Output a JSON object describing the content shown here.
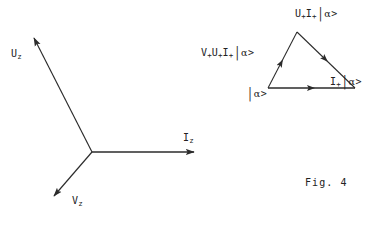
{
  "figure": {
    "caption": "Fig. 4",
    "background_color": "#ffffff",
    "ink_color": "#2b2b2b"
  },
  "axes_diagram": {
    "name": "three-axis-vector-diagram",
    "origin": {
      "x": 92,
      "y": 152
    },
    "vectors": [
      {
        "id": "uz",
        "label_base": "U",
        "label_sub": "z",
        "tip": {
          "x": 32,
          "y": 36
        },
        "direction": "up-left"
      },
      {
        "id": "iz",
        "label_base": "I",
        "label_sub": "z",
        "tip": {
          "x": 196,
          "y": 152
        },
        "direction": "right"
      },
      {
        "id": "vz",
        "label_base": "V",
        "label_sub": "z",
        "tip": {
          "x": 52,
          "y": 198
        },
        "direction": "down-left"
      }
    ]
  },
  "triangle_diagram": {
    "name": "state-transition-triangle",
    "vertices": {
      "apex": {
        "x": 297,
        "y": 32
      },
      "bottom_left": {
        "x": 268,
        "y": 88
      },
      "bottom_right": {
        "x": 355,
        "y": 88
      }
    },
    "edge_arrow_directions": {
      "left_edge": "toward-apex",
      "right_edge": "toward-apex",
      "bottom_edge": "toward-right"
    },
    "labels": {
      "apex": {
        "terms": [
          {
            "base": "U",
            "sub": "+"
          },
          {
            "base": "I",
            "sub": "+"
          }
        ],
        "ket": "| α >"
      },
      "left": {
        "terms": [
          {
            "base": "V",
            "sub": "+"
          },
          {
            "base": "U",
            "sub": "+"
          },
          {
            "base": "I",
            "sub": "+"
          }
        ],
        "ket": "| α >"
      },
      "right": {
        "terms": [
          {
            "base": "I",
            "sub": "+"
          }
        ],
        "ket": "| α >"
      },
      "bottom": {
        "terms": [],
        "ket": "| α >"
      }
    }
  },
  "text": {
    "uz_base": "U",
    "uz_sub": "z",
    "iz_base": "I",
    "iz_sub": "z",
    "vz_base": "V",
    "vz_sub": "z",
    "plus": "+",
    "u": "U",
    "i": "I",
    "v": "V",
    "bar": "|",
    "alpha": "α",
    "gt": ">",
    "caption": "Fig. 4"
  }
}
